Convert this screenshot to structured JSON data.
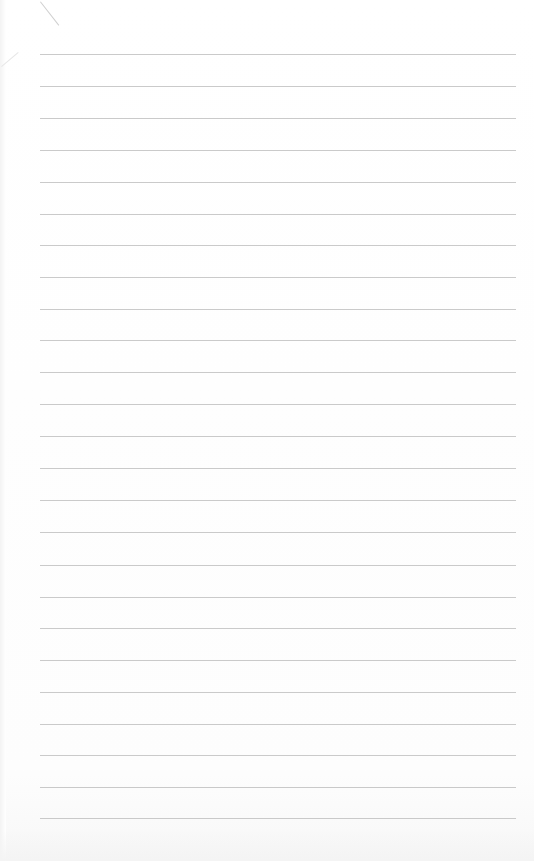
{
  "page": {
    "type": "lined-notebook-paper",
    "header_text": "",
    "line_count": 25,
    "line_color": "#b8b8b8",
    "background_color": "#ffffff",
    "lines": [
      {
        "y": 54
      },
      {
        "y": 86
      },
      {
        "y": 118
      },
      {
        "y": 150
      },
      {
        "y": 182
      },
      {
        "y": 214
      },
      {
        "y": 245
      },
      {
        "y": 277
      },
      {
        "y": 309
      },
      {
        "y": 340
      },
      {
        "y": 372
      },
      {
        "y": 404
      },
      {
        "y": 436
      },
      {
        "y": 468
      },
      {
        "y": 500
      },
      {
        "y": 532
      },
      {
        "y": 565
      },
      {
        "y": 597
      },
      {
        "y": 628
      },
      {
        "y": 660
      },
      {
        "y": 692
      },
      {
        "y": 724
      },
      {
        "y": 755
      },
      {
        "y": 787
      },
      {
        "y": 818
      }
    ]
  }
}
